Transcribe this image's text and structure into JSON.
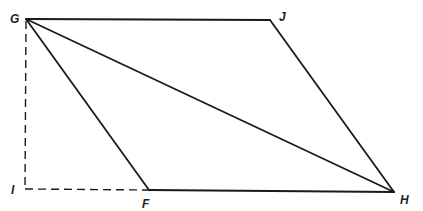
{
  "diagram": {
    "type": "geometry-figure",
    "colors": {
      "stroke": "#1a1a1a",
      "label": "#222222",
      "background": "#ffffff"
    },
    "vertices": {
      "G": {
        "label": "G",
        "x": 26,
        "y": 19,
        "label_x": 10,
        "label_y": 23
      },
      "J": {
        "label": "J",
        "x": 270,
        "y": 20,
        "label_x": 279,
        "label_y": 21
      },
      "H": {
        "label": "H",
        "x": 394,
        "y": 192,
        "label_x": 400,
        "label_y": 204
      },
      "F": {
        "label": "F",
        "x": 149,
        "y": 190,
        "label_x": 142,
        "label_y": 208
      },
      "I": {
        "label": "I",
        "x": 25,
        "y": 189,
        "label_x": 11,
        "label_y": 194
      }
    },
    "edges": [
      {
        "id": "GJ",
        "from": "G",
        "to": "J",
        "style": "solid"
      },
      {
        "id": "JH",
        "from": "J",
        "to": "H",
        "style": "solid"
      },
      {
        "id": "FH",
        "from": "F",
        "to": "H",
        "style": "solid"
      },
      {
        "id": "GF",
        "from": "G",
        "to": "F",
        "style": "solid"
      },
      {
        "id": "GH",
        "from": "G",
        "to": "H",
        "style": "solid",
        "role": "diagonal"
      },
      {
        "id": "GI",
        "from": "G",
        "to": "I",
        "style": "dashed",
        "role": "height"
      },
      {
        "id": "IF",
        "from": "I",
        "to": "F",
        "style": "dashed",
        "role": "extension"
      }
    ]
  }
}
